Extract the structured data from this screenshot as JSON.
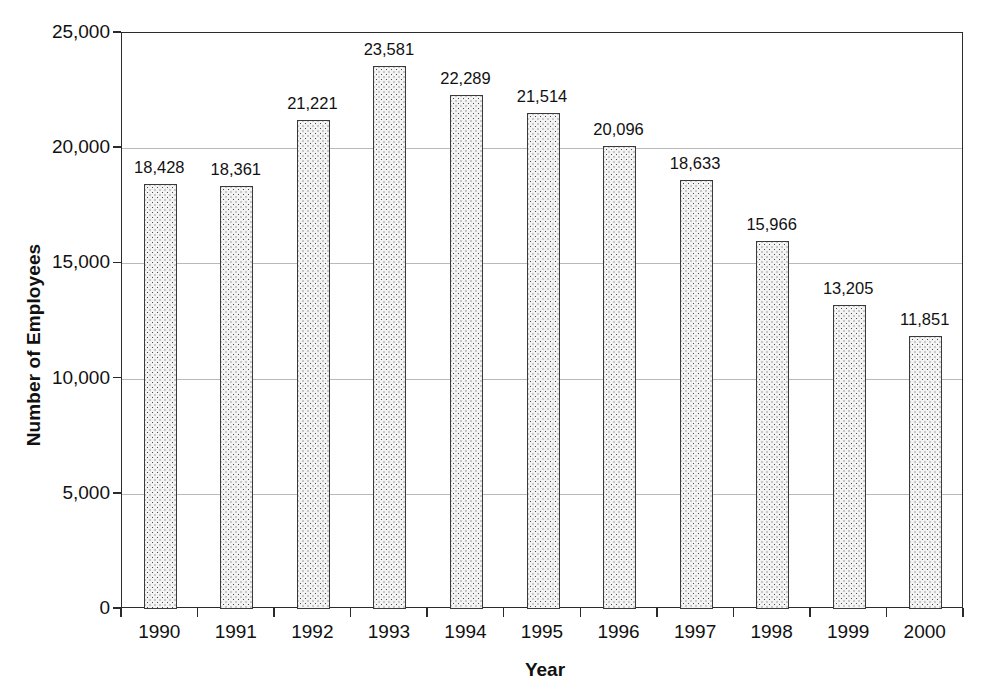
{
  "chart_data": {
    "type": "bar",
    "title": "",
    "xlabel": "Year",
    "ylabel": "Number of Employees",
    "categories": [
      "1990",
      "1991",
      "1992",
      "1993",
      "1994",
      "1995",
      "1996",
      "1997",
      "1998",
      "1999",
      "2000"
    ],
    "values": [
      18428,
      18361,
      21221,
      23581,
      22289,
      21514,
      20096,
      18633,
      15966,
      13205,
      11851
    ],
    "value_labels": [
      "18,428",
      "18,361",
      "21,221",
      "23,581",
      "22,289",
      "21,514",
      "20,096",
      "18,633",
      "15,966",
      "13,205",
      "11,851"
    ],
    "ylim": [
      0,
      25000
    ],
    "ytick_values": [
      0,
      5000,
      10000,
      15000,
      20000,
      25000
    ],
    "ytick_labels": [
      "0",
      "5,000",
      "10,000",
      "15,000",
      "20,000",
      "25,000"
    ],
    "grid": true,
    "grid_axis": "y",
    "legend": null,
    "legend_position": "none",
    "bar_fill": "#f3f3f3",
    "bar_pattern": "fine-dotted",
    "bar_border_color": "#3a3a3a",
    "gridline_color": "#b9b9b9",
    "axis_color": "#2b2b2b",
    "background_color": "#ffffff"
  }
}
